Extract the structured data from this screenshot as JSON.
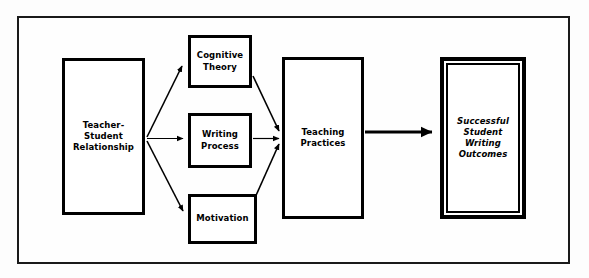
{
  "figure": {
    "type": "flowchart",
    "orientation": "left-to-right",
    "frame": {
      "style": "rectangular-border",
      "color": "#1a1a1a"
    },
    "background_color": "#fdfdfd",
    "line_color": "#000000"
  },
  "nodes": [
    {
      "id": "relationship",
      "label": "Teacher-\nStudent\nRelationship",
      "role": "antecedent",
      "border": "single",
      "italic": false
    },
    {
      "id": "cognitive",
      "label": "Cognitive\nTheory",
      "role": "mediator",
      "border": "single",
      "italic": false
    },
    {
      "id": "writing",
      "label": "Writing\nProcess",
      "role": "mediator",
      "border": "single",
      "italic": false
    },
    {
      "id": "motivation",
      "label": "Motivation",
      "role": "mediator",
      "border": "single",
      "italic": false
    },
    {
      "id": "teaching",
      "label": "Teaching\nPractices",
      "role": "process",
      "border": "single",
      "italic": false
    },
    {
      "id": "outcomes",
      "label": "Successful\nStudent\nWriting\nOutcomes",
      "role": "outcome",
      "border": "double",
      "italic": true
    }
  ],
  "edges": [
    {
      "id": "rel-to-cognitive",
      "from": "relationship",
      "to": "cognitive",
      "style": "thin-arrow",
      "direction": "up-right"
    },
    {
      "id": "rel-to-writing",
      "from": "relationship",
      "to": "writing",
      "style": "thin-arrow",
      "direction": "right"
    },
    {
      "id": "rel-to-motivation",
      "from": "relationship",
      "to": "motivation",
      "style": "thin-arrow",
      "direction": "down-right"
    },
    {
      "id": "cognitive-to-teaching",
      "from": "cognitive",
      "to": "teaching",
      "style": "thin-arrow",
      "direction": "down-right"
    },
    {
      "id": "writing-to-teaching",
      "from": "writing",
      "to": "teaching",
      "style": "thin-arrow",
      "direction": "right"
    },
    {
      "id": "motivation-to-teaching",
      "from": "motivation",
      "to": "teaching",
      "style": "thin-arrow",
      "direction": "up-right"
    },
    {
      "id": "teaching-to-outcomes",
      "from": "teaching",
      "to": "outcomes",
      "style": "thick-arrow",
      "direction": "right"
    }
  ]
}
